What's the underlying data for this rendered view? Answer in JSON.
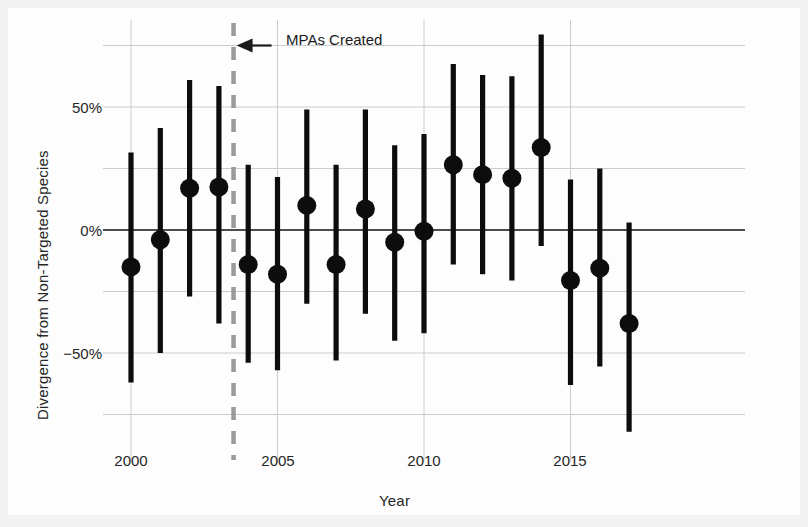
{
  "chart_data": {
    "type": "scatter",
    "title": "",
    "xlabel": "Year",
    "ylabel": "Divergence from Non-Targeted Species",
    "xlim": [
      1999.4,
      2017.7
    ],
    "ylim": [
      -0.92,
      0.88
    ],
    "xticks": [
      2000,
      2005,
      2010,
      2015
    ],
    "xtick_labels": [
      "2000",
      "2005",
      "2010",
      "2015"
    ],
    "yticks": [
      0.75,
      0.5,
      0.25,
      0.0,
      -0.25,
      -0.5,
      -0.75
    ],
    "ytick_labels": [
      "",
      "50%",
      "",
      "0%",
      "",
      "−50%",
      ""
    ],
    "ytick_labels_shown": [
      "50%",
      "0%",
      "−50%"
    ],
    "grid": true,
    "grid_color": "#cccccc",
    "zero_line": true,
    "zero_line_color": "#1a1a1a",
    "marker": "circle",
    "marker_color": "#0d0d0d",
    "errorbar_color": "#0d0d0d",
    "x": [
      2000,
      2001,
      2002,
      2003,
      2004,
      2005,
      2006,
      2007,
      2008,
      2009,
      2010,
      2011,
      2012,
      2013,
      2014,
      2015,
      2016,
      2017
    ],
    "values": [
      -0.15,
      -0.04,
      0.17,
      0.175,
      -0.14,
      -0.18,
      0.1,
      -0.14,
      0.085,
      -0.05,
      -0.005,
      0.265,
      0.225,
      0.21,
      0.335,
      -0.205,
      -0.155,
      -0.38
    ],
    "err_low": [
      -0.62,
      -0.5,
      -0.27,
      -0.38,
      -0.54,
      -0.57,
      -0.3,
      -0.53,
      -0.34,
      -0.45,
      -0.42,
      -0.14,
      -0.18,
      -0.205,
      -0.065,
      -0.63,
      -0.555,
      -0.82
    ],
    "err_high": [
      0.315,
      0.415,
      0.61,
      0.585,
      0.265,
      0.215,
      0.49,
      0.265,
      0.49,
      0.345,
      0.39,
      0.675,
      0.63,
      0.625,
      0.795,
      0.205,
      0.25,
      0.03
    ],
    "annotations": [
      {
        "text": "MPAs Created",
        "type": "arrow-label",
        "x": 2003.5,
        "y": 0.75,
        "vline_x": 2003.5,
        "vline_style": "dashed",
        "vline_color": "#9a9a9a"
      }
    ]
  },
  "annotation": {
    "mpas_label": "MPAs Created"
  },
  "axes": {
    "xlabel": "Year",
    "ylabel": "Divergence from Non-Targeted Species"
  }
}
